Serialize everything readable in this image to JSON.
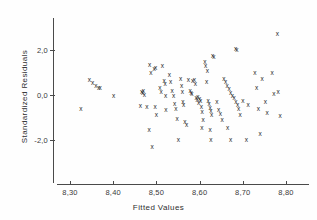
{
  "chart_data": {
    "type": "scatter",
    "title": "",
    "xlabel": "Fitted Values",
    "ylabel": "Standardized Residuals",
    "xlim": [
      8.26,
      8.82
    ],
    "ylim": [
      -3.1,
      3.0
    ],
    "xticks": [
      8.3,
      8.4,
      8.5,
      8.6,
      8.7,
      8.8
    ],
    "xtick_labels": [
      "8,30",
      "8,40",
      "8,50",
      "8,60",
      "8,70",
      "8,80"
    ],
    "yticks": [
      2.0,
      0.0,
      -2.0
    ],
    "ytick_labels": [
      "2,0",
      "0,0",
      "-2,0"
    ],
    "grid": false,
    "legend": null,
    "marker": "x",
    "marker_color": "#1e1e1e",
    "points": [
      [
        8.325,
        -0.6
      ],
      [
        8.345,
        0.65
      ],
      [
        8.352,
        0.52
      ],
      [
        8.36,
        0.4
      ],
      [
        8.366,
        0.33
      ],
      [
        8.37,
        0.3
      ],
      [
        8.401,
        -0.05
      ],
      [
        8.466,
        0.12
      ],
      [
        8.468,
        0.08
      ],
      [
        8.47,
        0.18
      ],
      [
        8.472,
        0.02
      ],
      [
        8.463,
        -0.47
      ],
      [
        8.478,
        -0.55
      ],
      [
        8.484,
        1.35
      ],
      [
        8.487,
        0.98
      ],
      [
        8.483,
        -1.55
      ],
      [
        8.49,
        -2.3
      ],
      [
        8.495,
        1.15
      ],
      [
        8.498,
        1.22
      ],
      [
        8.497,
        -0.55
      ],
      [
        8.5,
        -0.9
      ],
      [
        8.508,
        0.3
      ],
      [
        8.511,
        0.15
      ],
      [
        8.514,
        1.3
      ],
      [
        8.518,
        0.62
      ],
      [
        8.52,
        0.48
      ],
      [
        8.521,
        -0.02
      ],
      [
        8.522,
        -0.68
      ],
      [
        8.53,
        0.88
      ],
      [
        8.533,
        0.58
      ],
      [
        8.536,
        0.18
      ],
      [
        8.54,
        -0.05
      ],
      [
        8.542,
        -0.4
      ],
      [
        8.545,
        -0.62
      ],
      [
        8.548,
        -1.05
      ],
      [
        8.551,
        -1.98
      ],
      [
        8.556,
        0.72
      ],
      [
        8.558,
        0.4
      ],
      [
        8.56,
        0.12
      ],
      [
        8.561,
        -0.3
      ],
      [
        8.563,
        -0.45
      ],
      [
        8.566,
        -1.2
      ],
      [
        8.57,
        -1.32
      ],
      [
        8.574,
        0.65
      ],
      [
        8.578,
        0.2
      ],
      [
        8.58,
        0.1
      ],
      [
        8.582,
        0.05
      ],
      [
        8.584,
        0.62
      ],
      [
        8.588,
        0.68
      ],
      [
        8.59,
        0.5
      ],
      [
        8.592,
        -0.12
      ],
      [
        8.594,
        -0.22
      ],
      [
        8.596,
        -0.08
      ],
      [
        8.598,
        -0.35
      ],
      [
        8.6,
        -0.18
      ],
      [
        8.602,
        -0.25
      ],
      [
        8.604,
        -0.52
      ],
      [
        8.606,
        -0.75
      ],
      [
        8.608,
        -1.1
      ],
      [
        8.605,
        -1.48
      ],
      [
        8.612,
        1.45
      ],
      [
        8.614,
        1.3
      ],
      [
        8.618,
        1.05
      ],
      [
        8.616,
        0.58
      ],
      [
        8.62,
        -0.28
      ],
      [
        8.622,
        -0.4
      ],
      [
        8.624,
        -0.58
      ],
      [
        8.626,
        -0.72
      ],
      [
        8.628,
        -0.9
      ],
      [
        8.624,
        -1.55
      ],
      [
        8.626,
        -2.02
      ],
      [
        8.63,
        1.72
      ],
      [
        8.633,
        1.68
      ],
      [
        8.64,
        -0.32
      ],
      [
        8.644,
        -0.68
      ],
      [
        8.648,
        -0.85
      ],
      [
        8.652,
        -1.12
      ],
      [
        8.656,
        0.72
      ],
      [
        8.66,
        0.58
      ],
      [
        8.664,
        0.4
      ],
      [
        8.668,
        0.28
      ],
      [
        8.672,
        0.1
      ],
      [
        8.676,
        -0.02
      ],
      [
        8.68,
        -0.15
      ],
      [
        8.684,
        -0.3
      ],
      [
        8.688,
        -0.45
      ],
      [
        8.665,
        -1.45
      ],
      [
        8.672,
        -1.98
      ],
      [
        8.683,
        2.05
      ],
      [
        8.686,
        2.02
      ],
      [
        8.69,
        -0.62
      ],
      [
        8.694,
        -0.88
      ],
      [
        8.7,
        -0.28
      ],
      [
        8.708,
        -2.0
      ],
      [
        8.712,
        -0.42
      ],
      [
        8.728,
        1.0
      ],
      [
        8.732,
        0.3
      ],
      [
        8.736,
        -0.6
      ],
      [
        8.74,
        -1.72
      ],
      [
        8.745,
        0.7
      ],
      [
        8.752,
        -0.32
      ],
      [
        8.756,
        -0.78
      ],
      [
        8.768,
        1.0
      ],
      [
        8.772,
        0.05
      ],
      [
        8.782,
        0.15
      ],
      [
        8.786,
        -0.95
      ],
      [
        8.78,
        2.7
      ]
    ]
  }
}
